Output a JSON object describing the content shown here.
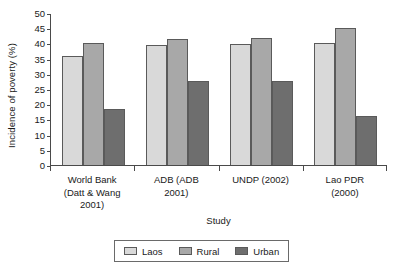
{
  "chart_data": {
    "type": "bar",
    "title": "",
    "xlabel": "Study",
    "ylabel": "Incidence of poverty (%)",
    "ylim": [
      0,
      50
    ],
    "ytick_step": 5,
    "yticks": [
      50,
      45,
      40,
      35,
      30,
      25,
      20,
      15,
      10,
      5,
      0
    ],
    "grid": false,
    "legend_position": "bottom",
    "categories": [
      "World Bank (Datt & Wang 2001)",
      "ADB (ADB 2001)",
      "UNDP (2002)",
      "Lao PDR (2000)"
    ],
    "category_lines": [
      [
        "World Bank",
        "(Datt & Wang",
        "2001)"
      ],
      [
        "ADB (ADB",
        "2001)"
      ],
      [
        "UNDP (2002)"
      ],
      [
        "Lao PDR",
        "(2000)"
      ]
    ],
    "series": [
      {
        "name": "Laos",
        "color": "#d9d9d9",
        "values": [
          35.8,
          39.6,
          39.9,
          40.1
        ]
      },
      {
        "name": "Rural",
        "color": "#a8a8a8",
        "values": [
          40.1,
          41.5,
          41.8,
          45.0
        ]
      },
      {
        "name": "Urban",
        "color": "#6e6e6e",
        "values": [
          18.4,
          27.8,
          27.6,
          16.2
        ]
      }
    ]
  },
  "legend": {
    "items": [
      {
        "label": "Laos"
      },
      {
        "label": "Rural"
      },
      {
        "label": "Urban"
      }
    ]
  }
}
